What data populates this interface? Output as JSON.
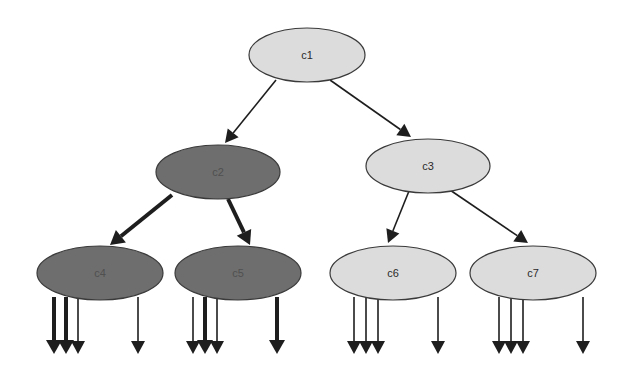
{
  "colors": {
    "background": "#ffffff",
    "light_fill": "#dcdcdc",
    "dark_fill": "#6e6e6e",
    "stroke": "#3a3a3a",
    "edge": "#1e1e1e",
    "light_text": "#2a2a2a",
    "dark_text": "#505050"
  },
  "nodes": [
    {
      "id": "c1",
      "label": "c1",
      "cx": 307,
      "cy": 55,
      "rx": 58,
      "ry": 27,
      "style": "light"
    },
    {
      "id": "c2",
      "label": "c2",
      "cx": 218,
      "cy": 172,
      "rx": 62,
      "ry": 27,
      "style": "dark"
    },
    {
      "id": "c3",
      "label": "c3",
      "cx": 428,
      "cy": 166,
      "rx": 62,
      "ry": 27,
      "style": "light"
    },
    {
      "id": "c4",
      "label": "c4",
      "cx": 100,
      "cy": 273,
      "rx": 63,
      "ry": 27,
      "style": "dark"
    },
    {
      "id": "c5",
      "label": "c5",
      "cx": 238,
      "cy": 273,
      "rx": 63,
      "ry": 27,
      "style": "dark"
    },
    {
      "id": "c6",
      "label": "c6",
      "cx": 393,
      "cy": 273,
      "rx": 63,
      "ry": 27,
      "style": "light"
    },
    {
      "id": "c7",
      "label": "c7",
      "cx": 533,
      "cy": 273,
      "rx": 63,
      "ry": 27,
      "style": "light"
    }
  ],
  "edges": [
    {
      "from": "c1",
      "to": "c2",
      "x1": 276,
      "y1": 80,
      "x2": 225,
      "y2": 143,
      "weight": "thin"
    },
    {
      "from": "c1",
      "to": "c3",
      "x1": 330,
      "y1": 80,
      "x2": 411,
      "y2": 137,
      "weight": "thin"
    },
    {
      "from": "c2",
      "to": "c4",
      "x1": 172,
      "y1": 195,
      "x2": 110,
      "y2": 245,
      "weight": "thick"
    },
    {
      "from": "c2",
      "to": "c5",
      "x1": 228,
      "y1": 199,
      "x2": 250,
      "y2": 245,
      "weight": "thick"
    },
    {
      "from": "c3",
      "to": "c6",
      "x1": 409,
      "y1": 191,
      "x2": 388,
      "y2": 243,
      "weight": "thin"
    },
    {
      "from": "c3",
      "to": "c7",
      "x1": 450,
      "y1": 190,
      "x2": 528,
      "y2": 243,
      "weight": "thin"
    }
  ],
  "output_arrows": [
    {
      "from": "c4",
      "x": 54,
      "weight": "thick"
    },
    {
      "from": "c4",
      "x": 66,
      "weight": "thick"
    },
    {
      "from": "c4",
      "x": 78,
      "weight": "thin"
    },
    {
      "from": "c4",
      "x": 138,
      "weight": "thin"
    },
    {
      "from": "c5",
      "x": 193,
      "weight": "thin"
    },
    {
      "from": "c5",
      "x": 205,
      "weight": "thick"
    },
    {
      "from": "c5",
      "x": 217,
      "weight": "thin"
    },
    {
      "from": "c5",
      "x": 277,
      "weight": "thick"
    },
    {
      "from": "c6",
      "x": 354,
      "weight": "thin"
    },
    {
      "from": "c6",
      "x": 366,
      "weight": "thin"
    },
    {
      "from": "c6",
      "x": 378,
      "weight": "thin"
    },
    {
      "from": "c6",
      "x": 438,
      "weight": "thin"
    },
    {
      "from": "c7",
      "x": 499,
      "weight": "thin"
    },
    {
      "from": "c7",
      "x": 511,
      "weight": "thin"
    },
    {
      "from": "c7",
      "x": 523,
      "weight": "thin"
    },
    {
      "from": "c7",
      "x": 583,
      "weight": "thin"
    }
  ],
  "output_arrow_y": {
    "start": 297,
    "end": 354
  }
}
